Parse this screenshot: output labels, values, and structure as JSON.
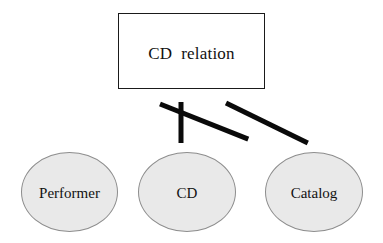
{
  "diagram": {
    "type": "hierarchy-tree",
    "background_color": "#ffffff",
    "root": {
      "id": "cd-relation",
      "shape": "rectangle",
      "label": "CD  relation",
      "fill_color": "#ffffff",
      "border_color": "#1a1a1a",
      "x": 118,
      "y": 13,
      "width": 147,
      "height": 76
    },
    "children": [
      {
        "id": "performer",
        "shape": "ellipse",
        "label": "Performer",
        "fill_color": "#e9e9e9",
        "border_color": "#8d8d8d",
        "x": 21,
        "y": 152,
        "width": 97,
        "height": 80
      },
      {
        "id": "cd",
        "shape": "ellipse",
        "label": "CD",
        "fill_color": "#e9e9e9",
        "border_color": "#8d8d8d",
        "x": 138,
        "y": 152,
        "width": 98,
        "height": 80
      },
      {
        "id": "catalog",
        "shape": "ellipse",
        "label": "Catalog",
        "fill_color": "#e9e9e9",
        "border_color": "#8d8d8d",
        "x": 265,
        "y": 152,
        "width": 98,
        "height": 80
      }
    ],
    "edges": [
      {
        "id": "edge-root-performer",
        "from": "cd-relation",
        "to": "performer",
        "color": "#0a0a0a",
        "thickness": 5,
        "x1": 160,
        "y1": 104,
        "x2": 72,
        "y2": 139
      },
      {
        "id": "edge-root-cd",
        "from": "cd-relation",
        "to": "cd",
        "color": "#0a0a0a",
        "thickness": 5,
        "x1": 181,
        "y1": 102,
        "x2": 181,
        "y2": 143
      },
      {
        "id": "edge-root-catalog",
        "from": "cd-relation",
        "to": "catalog",
        "color": "#0a0a0a",
        "thickness": 5,
        "x1": 226,
        "y1": 103,
        "x2": 308,
        "y2": 143
      }
    ]
  }
}
